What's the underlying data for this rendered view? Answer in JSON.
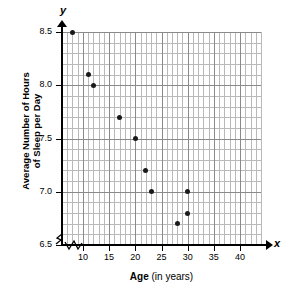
{
  "chart_data": {
    "type": "scatter",
    "title": "",
    "xlabel": "Age (in years)",
    "xlabel_bold_part": "Age",
    "xlabel_regular_part": " (in years)",
    "ylabel": "Average Number of Hours of Sleep per Day",
    "ylabel_line1": "Average Number of Hours",
    "ylabel_line2": "of Sleep per Day",
    "x_axis_letter": "x",
    "y_axis_letter": "y",
    "xlim": [
      6,
      44
    ],
    "ylim": [
      6.5,
      8.5
    ],
    "x_ticks": [
      10,
      15,
      20,
      25,
      30,
      35,
      40
    ],
    "x_tick_labels": [
      "10",
      "15",
      "20",
      "25",
      "30",
      "35",
      "40"
    ],
    "y_ticks": [
      6.5,
      7.0,
      7.5,
      8.0,
      8.5
    ],
    "y_tick_labels": [
      "6.5",
      "7.0",
      "7.5",
      "8.0",
      "8.5"
    ],
    "x_minor_step": 1,
    "x_major_step": 5,
    "y_minor_step": 0.1,
    "y_major_step": 0.5,
    "grid": true,
    "legend": false,
    "axis_break_x": true,
    "axis_break_y": true,
    "point_color": "#1a1a1a",
    "grid_minor_color": "#b9b9b9",
    "grid_major_color": "#8a8a8a",
    "axis_color": "#000000",
    "points": [
      {
        "x": 8,
        "y": 8.5
      },
      {
        "x": 11,
        "y": 8.1
      },
      {
        "x": 12,
        "y": 8.0
      },
      {
        "x": 17,
        "y": 7.7
      },
      {
        "x": 20,
        "y": 7.5
      },
      {
        "x": 22,
        "y": 7.2
      },
      {
        "x": 23,
        "y": 7.0
      },
      {
        "x": 28,
        "y": 6.7
      },
      {
        "x": 30,
        "y": 6.8
      },
      {
        "x": 30,
        "y": 7.0
      }
    ]
  }
}
